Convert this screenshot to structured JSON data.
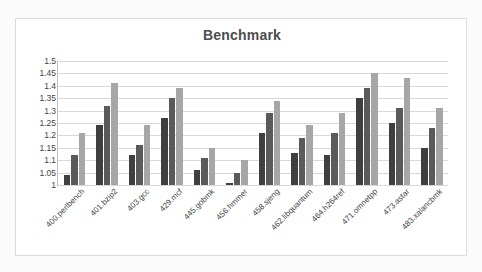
{
  "chart_data": {
    "type": "bar",
    "title": "Benchmark",
    "xlabel": "",
    "ylabel": "",
    "ylim": [
      1,
      1.5
    ],
    "ytick_labels": [
      "1.5",
      "1.45",
      "1.4",
      "1.35",
      "1.3",
      "1.25",
      "1.2",
      "1.15",
      "1.1",
      "1.05",
      "1"
    ],
    "yticks": [
      1.5,
      1.45,
      1.4,
      1.35,
      1.3,
      1.25,
      1.2,
      1.15,
      1.1,
      1.05,
      1.0
    ],
    "grid": true,
    "legend": "none",
    "categories": [
      "400.perlbench",
      "401.bzip2",
      "403.gcc",
      "429.mcf",
      "445.gobmk",
      "456.hmmer",
      "458.sjeng",
      "462.libquantum",
      "464.h264ref",
      "471.omnetpp",
      "473.astar",
      "483.xalancbmk"
    ],
    "series": [
      {
        "name": "series-1",
        "color": "#3f3f3f",
        "values": [
          1.04,
          1.24,
          1.12,
          1.27,
          1.06,
          1.01,
          1.21,
          1.13,
          1.12,
          1.35,
          1.25,
          1.15
        ]
      },
      {
        "name": "series-2",
        "color": "#5a5a5a",
        "values": [
          1.12,
          1.32,
          1.16,
          1.35,
          1.11,
          1.05,
          1.29,
          1.19,
          1.21,
          1.39,
          1.31,
          1.23
        ]
      },
      {
        "name": "series-3",
        "color": "#a6a6a6",
        "values": [
          1.21,
          1.41,
          1.24,
          1.39,
          1.15,
          1.1,
          1.34,
          1.24,
          1.29,
          1.45,
          1.43,
          1.31
        ]
      }
    ]
  }
}
